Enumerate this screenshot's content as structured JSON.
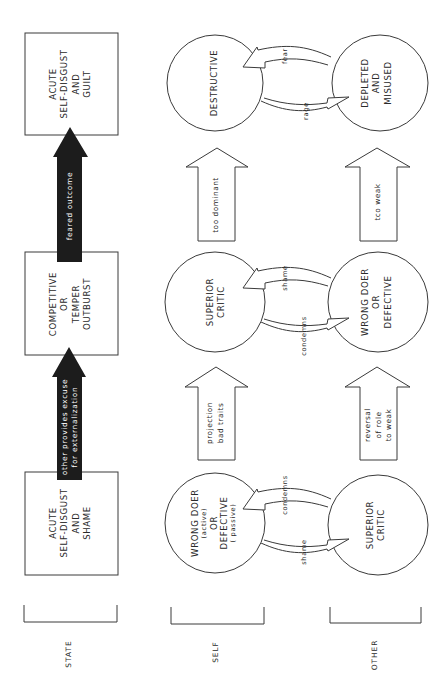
{
  "diagram": {
    "orientation": "rotated-90-ccw",
    "colors": {
      "stroke": "#3a3a3a",
      "fill_dark": "#1c1c1c",
      "background": "#ffffff"
    },
    "columns": [
      {
        "id": "state",
        "label": "STATE"
      },
      {
        "id": "self",
        "label": "SELF"
      },
      {
        "id": "other",
        "label": "OTHER"
      }
    ],
    "stages": [
      {
        "state": [
          "ACUTE",
          "SELF-DISGUST",
          "AND",
          "SHAME"
        ],
        "self": [
          "WRONG DOER",
          "(active)",
          "OR",
          "DEFECTIVE",
          "( passive)"
        ],
        "other": [
          "SUPERIOR",
          "CRITIC"
        ],
        "to_self_arrow": "condemns",
        "to_other_arrow": "shame"
      },
      {
        "state": [
          "COMPETITIVE",
          "OR",
          "TEMPER",
          "OUTBURST"
        ],
        "self": [
          "SUPERIOR",
          "CRITIC"
        ],
        "other": [
          "WRONG DOER",
          "OR",
          "DEFECTIVE"
        ],
        "to_self_arrow": "shame",
        "to_other_arrow": "condemns"
      },
      {
        "state": [
          "ACUTE",
          "SELF-DISGUST",
          "AND",
          "GUILT"
        ],
        "self": [
          "DESTRUCTIVE"
        ],
        "other": [
          "DEPLETED",
          "AND",
          "MISUSED"
        ],
        "to_self_arrow": "fear",
        "to_other_arrow": "rage"
      }
    ],
    "transitions": [
      {
        "state": [
          "other provides excuse",
          "for externalization"
        ],
        "self": [
          "projection",
          "bad traits"
        ],
        "other": [
          "reversal",
          "of role",
          "to weak"
        ]
      },
      {
        "state": [
          "feared outcome"
        ],
        "self": [
          "too dominant"
        ],
        "other": [
          "tco weak"
        ]
      }
    ]
  }
}
